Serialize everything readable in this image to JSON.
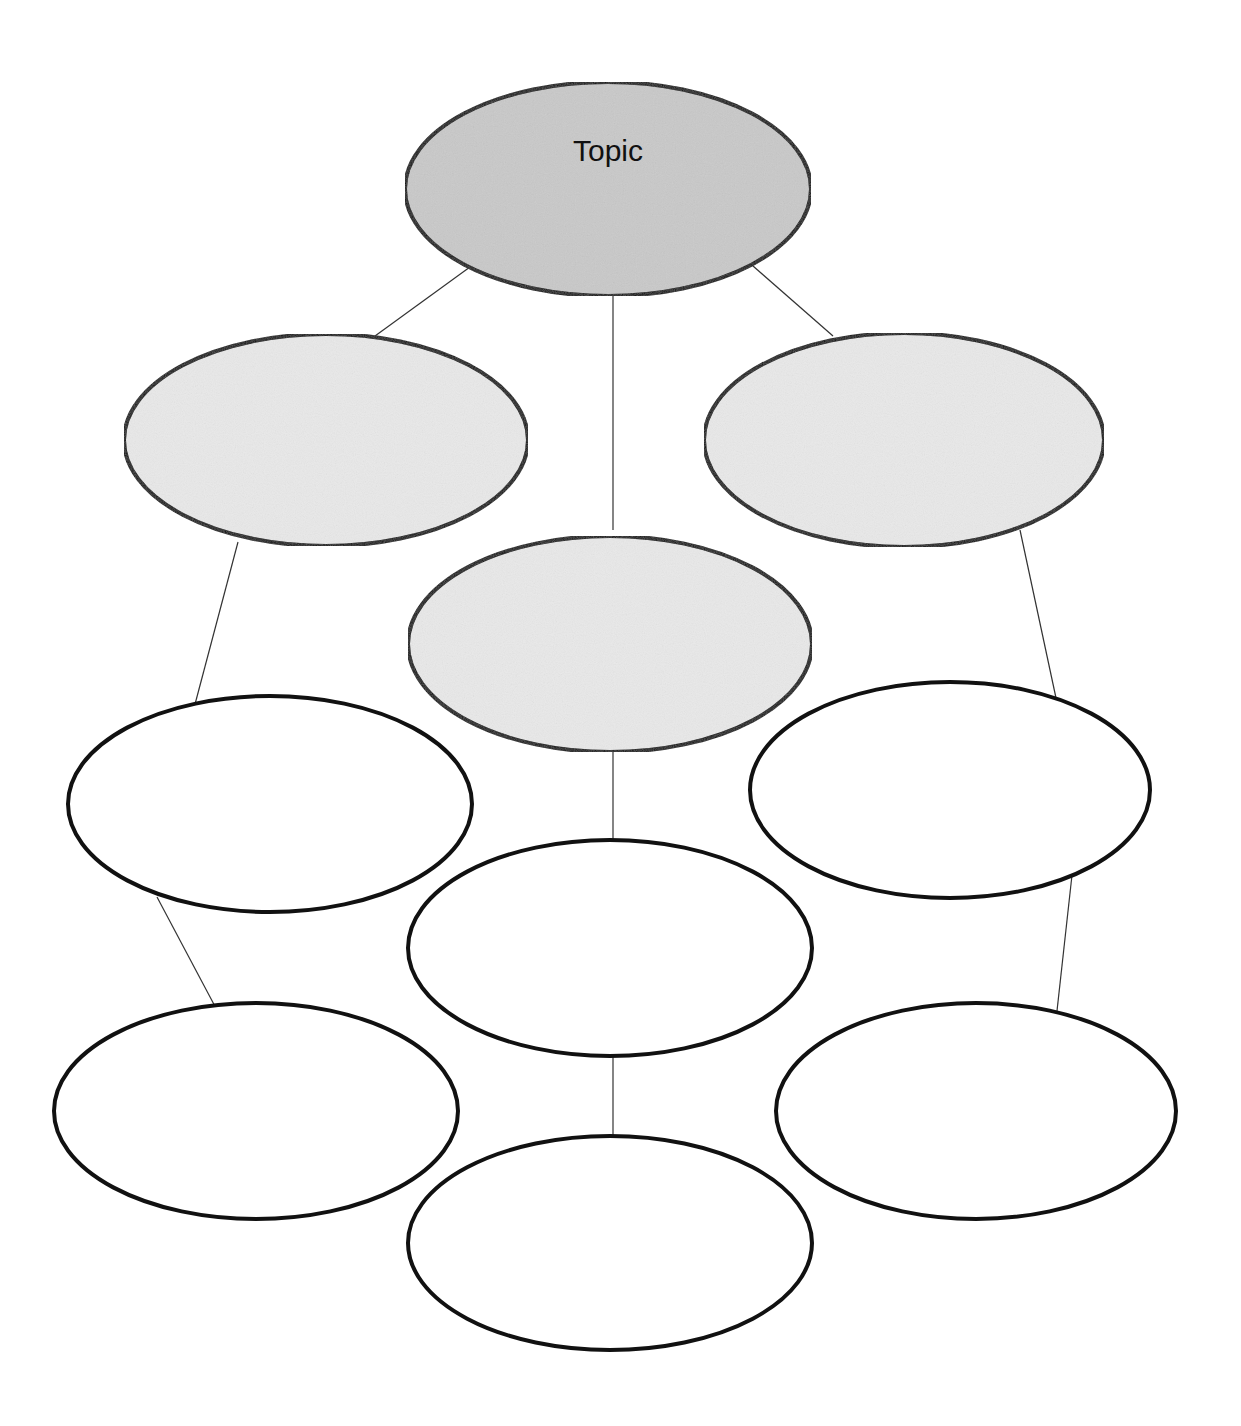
{
  "diagram": {
    "type": "graphic-organizer",
    "colors": {
      "topic_fill": "#c9c9c9",
      "subtopic_fill": "#e9e9e9",
      "detail_fill": "#ffffff",
      "stroke": "#111111",
      "connector": "#333333"
    },
    "nodes": [
      {
        "id": "topic",
        "label": "Topic",
        "cx": 608,
        "cy": 189,
        "rx": 203,
        "ry": 107,
        "level": 0
      },
      {
        "id": "subtopic-left",
        "label": "",
        "cx": 326,
        "cy": 440,
        "rx": 202,
        "ry": 106,
        "level": 1
      },
      {
        "id": "subtopic-center",
        "label": "",
        "cx": 610,
        "cy": 644,
        "rx": 202,
        "ry": 108,
        "level": 1
      },
      {
        "id": "subtopic-right",
        "label": "",
        "cx": 904,
        "cy": 440,
        "rx": 200,
        "ry": 107,
        "level": 1
      },
      {
        "id": "detail-left-1",
        "label": "",
        "cx": 270,
        "cy": 804,
        "rx": 202,
        "ry": 108,
        "level": 2
      },
      {
        "id": "detail-center-1",
        "label": "",
        "cx": 610,
        "cy": 948,
        "rx": 202,
        "ry": 108,
        "level": 2
      },
      {
        "id": "detail-right-1",
        "label": "",
        "cx": 950,
        "cy": 790,
        "rx": 200,
        "ry": 108,
        "level": 2
      },
      {
        "id": "detail-left-2",
        "label": "",
        "cx": 256,
        "cy": 1111,
        "rx": 202,
        "ry": 108,
        "level": 2
      },
      {
        "id": "detail-center-2",
        "label": "",
        "cx": 610,
        "cy": 1243,
        "rx": 202,
        "ry": 107,
        "level": 2
      },
      {
        "id": "detail-right-2",
        "label": "",
        "cx": 976,
        "cy": 1111,
        "rx": 200,
        "ry": 108,
        "level": 2
      }
    ],
    "edges": [
      {
        "from": "topic",
        "to": "subtopic-left",
        "x1": 470,
        "y1": 267,
        "x2": 375,
        "y2": 336
      },
      {
        "from": "topic",
        "to": "subtopic-center",
        "x1": 613,
        "y1": 296,
        "x2": 613,
        "y2": 530
      },
      {
        "from": "topic",
        "to": "subtopic-right",
        "x1": 753,
        "y1": 266,
        "x2": 833,
        "y2": 336
      },
      {
        "from": "subtopic-left",
        "to": "detail-left-1",
        "x1": 238,
        "y1": 542,
        "x2": 194,
        "y2": 708
      },
      {
        "from": "subtopic-right",
        "to": "detail-right-1",
        "x1": 1020,
        "y1": 530,
        "x2": 1056,
        "y2": 698
      },
      {
        "from": "subtopic-center",
        "to": "detail-center-1",
        "x1": 613,
        "y1": 752,
        "x2": 613,
        "y2": 840
      },
      {
        "from": "detail-left-1",
        "to": "detail-left-2",
        "x1": 157,
        "y1": 897,
        "x2": 218,
        "y2": 1012
      },
      {
        "from": "detail-right-1",
        "to": "detail-right-2",
        "x1": 1073,
        "y1": 866,
        "x2": 1056,
        "y2": 1020
      },
      {
        "from": "detail-center-1",
        "to": "detail-center-2",
        "x1": 613,
        "y1": 1056,
        "x2": 613,
        "y2": 1136
      }
    ]
  }
}
